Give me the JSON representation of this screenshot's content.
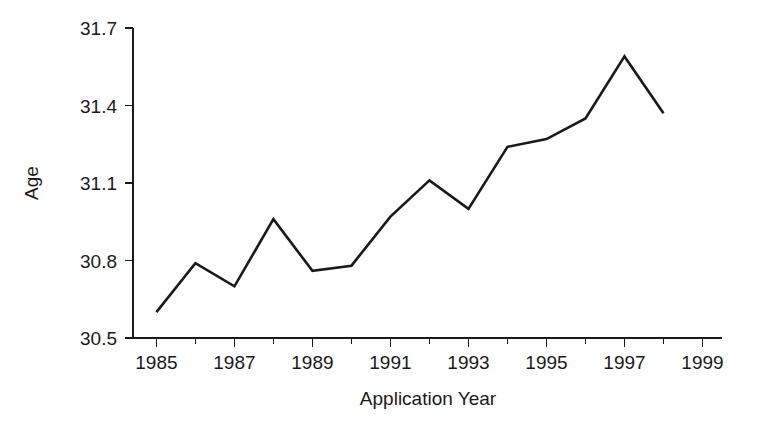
{
  "chart_data": {
    "type": "line",
    "title": "",
    "subtitle": "",
    "xlabel": "Application Year",
    "ylabel": "Age",
    "x": [
      1985,
      1986,
      1987,
      1988,
      1989,
      1990,
      1991,
      1992,
      1993,
      1994,
      1995,
      1996,
      1997,
      1998
    ],
    "values": [
      30.6,
      30.79,
      30.7,
      30.96,
      30.76,
      30.78,
      30.97,
      31.11,
      31.0,
      31.24,
      31.27,
      31.35,
      31.59,
      31.37
    ],
    "series": [
      {
        "name": "Age",
        "values": [
          30.6,
          30.79,
          30.7,
          30.96,
          30.76,
          30.78,
          30.97,
          31.11,
          31.0,
          31.24,
          31.27,
          31.35,
          31.59,
          31.37
        ]
      }
    ],
    "xlim": [
      1984.4,
      1999.5
    ],
    "ylim": [
      30.5,
      31.7
    ],
    "x_major_ticks": [
      1985,
      1987,
      1989,
      1991,
      1993,
      1995,
      1997,
      1999
    ],
    "x_minor_ticks": [
      1986,
      1988,
      1990,
      1992,
      1994,
      1996,
      1998
    ],
    "x_tick_labels": [
      "1985",
      "1987",
      "1989",
      "1991",
      "1993",
      "1995",
      "1997",
      "1999"
    ],
    "y_ticks": [
      30.5,
      30.8,
      31.1,
      31.4,
      31.7
    ],
    "y_tick_labels": [
      "30.5",
      "30.8",
      "31.1",
      "31.4",
      "31.7"
    ],
    "grid": false,
    "legend": false,
    "legend_position": "none",
    "line_color": "#1a1a1a",
    "background_color": "#ffffff",
    "axis_color": "#1a1a1a"
  }
}
